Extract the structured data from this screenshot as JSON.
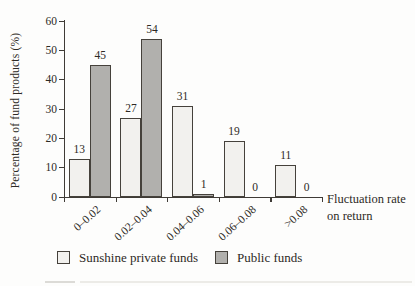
{
  "figure": {
    "ylabel": "Percentage of fund products (%)",
    "xlabel_line1": "Fluctuation rate",
    "xlabel_line2": "on return"
  },
  "chart_data": {
    "type": "bar",
    "title": "",
    "categories": [
      "0–0.02",
      "0.02–0.04",
      "0.04–0.06",
      "0.06–0.08",
      ">0.08"
    ],
    "series": [
      {
        "name": "Sunshine private funds",
        "values": [
          13,
          27,
          31,
          19,
          11
        ],
        "fill": "#f2f1ee",
        "border": "#45413b"
      },
      {
        "name": "Public funds",
        "values": [
          45,
          54,
          1,
          0,
          0
        ],
        "fill": "#b1b0ad",
        "border": "#45413b"
      }
    ],
    "ylabel": "Percentage of fund products (%)",
    "xlabel": "Fluctuation rate on return",
    "ylim": [
      0,
      60
    ],
    "yticks": [
      0,
      10,
      20,
      30,
      40,
      50,
      60
    ],
    "grid": false,
    "legend_position": "bottom",
    "value_labels": true
  },
  "legend": {
    "items": [
      {
        "label": "Sunshine private funds"
      },
      {
        "label": "Public funds"
      }
    ]
  },
  "colors": {
    "private_fill": "#f2f1ee",
    "public_fill": "#b1b0ad",
    "axis": "#3f3b36",
    "text": "#2d2a25",
    "page_rule": "#e2e1dd"
  }
}
